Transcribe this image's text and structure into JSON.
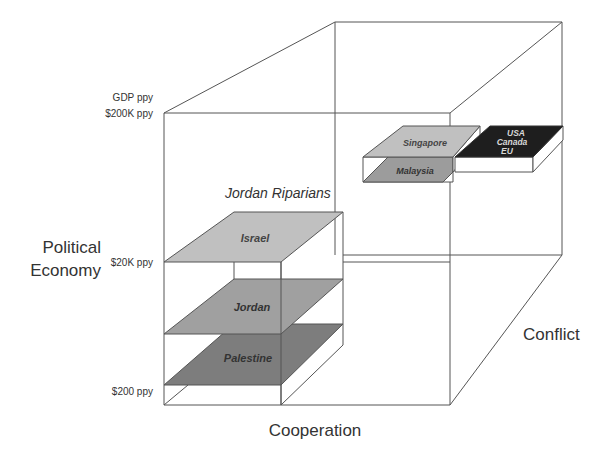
{
  "diagram": {
    "title": "Jordan Riparians",
    "axes": {
      "vertical": {
        "label_line1": "Political",
        "label_line2": "Economy"
      },
      "horizontal": {
        "label": "Cooperation"
      },
      "depth": {
        "label": "Conflict"
      }
    },
    "ticks": {
      "top_line1": "GDP ppy",
      "top_line2": "$200K ppy",
      "middle": "$20K ppy",
      "bottom": "$200 ppy"
    },
    "planes": [
      {
        "label": "Israel",
        "color": "#bdbdbd"
      },
      {
        "label": "Jordan",
        "color": "#9c9c9c"
      },
      {
        "label": "Palestine",
        "color": "#7d7d7d"
      },
      {
        "label": "Singapore",
        "color": "#bdbdbd"
      },
      {
        "label": "Malaysia",
        "color": "#9c9c9c"
      },
      {
        "label_line1": "USA",
        "label_line2": "Canada",
        "label_line3": "EU",
        "color": "#1e1e1e"
      }
    ]
  }
}
